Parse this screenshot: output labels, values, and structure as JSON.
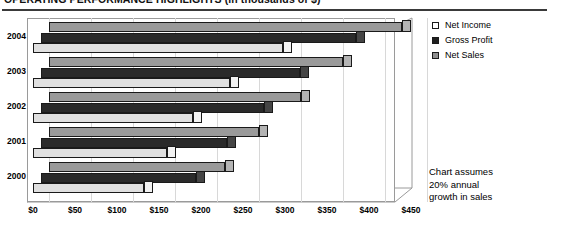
{
  "title": "OPERATING PERFORMANCE HIGHLIGHTS (in thousands of $)",
  "annotation": {
    "line1": "Chart assumes",
    "line2": "20% annual",
    "line3": "growth in sales"
  },
  "legend": {
    "position": "right-top",
    "items": [
      {
        "label": "Net Income",
        "swatch": "legend-swatch-net-income",
        "color": "#ffffff"
      },
      {
        "label": "Gross Profit",
        "swatch": "legend-swatch-gross-profit",
        "color": "#1f1f1f"
      },
      {
        "label": "Net Sales",
        "swatch": "legend-swatch-net-sales",
        "color": "#8f8f8f"
      }
    ]
  },
  "chart_data": {
    "type": "bar",
    "orientation": "horizontal",
    "style": "3d-clustered",
    "title": "OPERATING PERFORMANCE HIGHLIGHTS (in thousands of $)",
    "xlabel": "",
    "ylabel": "",
    "categories": [
      "2004",
      "2003",
      "2002",
      "2001",
      "2000"
    ],
    "series": [
      {
        "name": "Net Income",
        "values": [
          298,
          235,
          190,
          160,
          132
        ],
        "color": "#e0e0e0"
      },
      {
        "name": "Gross Profit",
        "values": [
          375,
          308,
          265,
          222,
          185
        ],
        "color": "#2a2a2a"
      },
      {
        "name": "Net Sales",
        "values": [
          420,
          350,
          300,
          250,
          210
        ],
        "color": "#9a9a9a"
      }
    ],
    "xlim": [
      0,
      450
    ],
    "xticks": [
      0,
      50,
      100,
      150,
      200,
      250,
      300,
      350,
      400,
      450
    ],
    "xticklabels": [
      "$0",
      "$50",
      "$100",
      "$150",
      "$200",
      "$250",
      "$300",
      "$350",
      "$400",
      "$450"
    ],
    "grid": true,
    "legend": "right",
    "annotations": [
      "Chart assumes 20% annual growth in sales"
    ]
  }
}
